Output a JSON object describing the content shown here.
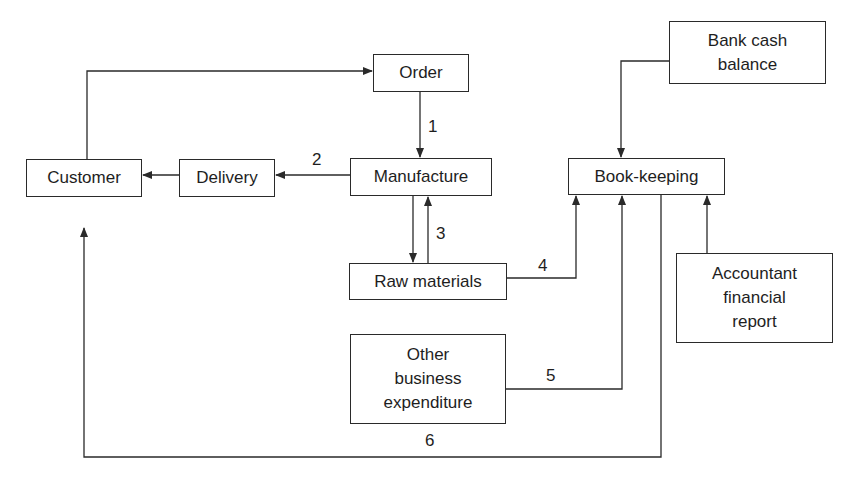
{
  "diagram": {
    "nodes": {
      "order": "Order",
      "customer": "Customer",
      "delivery": "Delivery",
      "manufacture": "Manufacture",
      "raw_materials": "Raw materials",
      "bank_cash_balance": "Bank cash\nbalance",
      "book_keeping": "Book-keeping",
      "accountant_report": "Accountant\nfinancial\nreport",
      "other_expenditure": "Other\nbusiness\nexpenditure"
    },
    "edge_labels": {
      "e1": "1",
      "e2": "2",
      "e3": "3",
      "e4": "4",
      "e5": "5",
      "e6": "6"
    },
    "edges": [
      {
        "from": "customer",
        "to": "order"
      },
      {
        "from": "order",
        "to": "manufacture",
        "label": "1"
      },
      {
        "from": "manufacture",
        "to": "delivery",
        "label": "2"
      },
      {
        "from": "delivery",
        "to": "customer"
      },
      {
        "from": "manufacture",
        "to": "raw_materials"
      },
      {
        "from": "raw_materials",
        "to": "manufacture",
        "label": "3"
      },
      {
        "from": "raw_materials",
        "to": "book_keeping",
        "label": "4"
      },
      {
        "from": "other_expenditure",
        "to": "book_keeping",
        "label": "5"
      },
      {
        "from": "book_keeping",
        "to": "customer",
        "label": "6"
      },
      {
        "from": "bank_cash_balance",
        "to": "book_keeping"
      },
      {
        "from": "accountant_report",
        "to": "book_keeping"
      }
    ],
    "line_color": "#2a2a2a"
  }
}
